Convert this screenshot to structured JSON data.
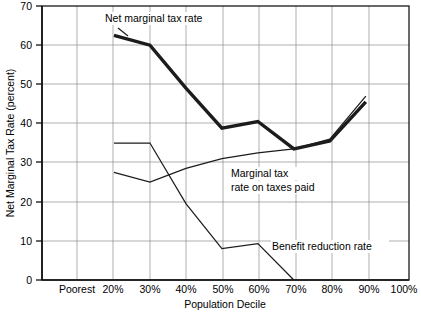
{
  "chart_data": {
    "type": "line",
    "title": "",
    "xlabel": "Population Decile",
    "ylabel": "Net Marginal Tax Rate (percent)",
    "ylim": [
      0,
      70
    ],
    "yticks": [
      0,
      10,
      20,
      30,
      40,
      50,
      60,
      70
    ],
    "ytick_labels": [
      "0",
      "10",
      "20",
      "30",
      "40",
      "50",
      "60",
      "70"
    ],
    "categories": [
      "Poorest",
      "20%",
      "30%",
      "40%",
      "50%",
      "60%",
      "70%",
      "80%",
      "90%",
      "100%"
    ],
    "grid": true,
    "legend_position": "inline-annotations",
    "series": [
      {
        "name": "Net marginal tax rate",
        "style": "thick",
        "x": [
          "20%",
          "30%",
          "40%",
          "50%",
          "60%",
          "70%",
          "80%",
          "90%"
        ],
        "values": [
          62.5,
          60.0,
          49.0,
          38.8,
          40.5,
          33.5,
          35.5,
          45.5
        ]
      },
      {
        "name": "Marginal tax rate on taxes paid",
        "style": "thin",
        "x": [
          "20%",
          "30%",
          "40%",
          "50%",
          "60%",
          "70%",
          "80%",
          "90%"
        ],
        "values": [
          27.5,
          25.0,
          28.5,
          31.0,
          32.5,
          33.5,
          36.0,
          47.0
        ]
      },
      {
        "name": "Benefit reduction rate",
        "style": "thin",
        "x": [
          "20%",
          "30%",
          "40%",
          "50%",
          "60%",
          "70%"
        ],
        "values": [
          35.0,
          35.0,
          19.5,
          8.0,
          9.3,
          0.0
        ]
      }
    ],
    "annotations": [
      {
        "text": "Net marginal tax rate",
        "x_px": 105,
        "y_px": 22
      },
      {
        "text": "Marginal tax",
        "x_px": 231,
        "y_px": 177
      },
      {
        "text": "rate on taxes paid",
        "x_px": 231,
        "y_px": 191
      },
      {
        "text": "Benefit reduction rate",
        "x_px": 272,
        "y_px": 250
      }
    ]
  },
  "axes": {
    "y_title": "Net Marginal Tax Rate (percent)",
    "x_title": "Population Decile",
    "y_tick_labels": [
      "70",
      "60",
      "50",
      "40",
      "30",
      "20",
      "10",
      "0"
    ],
    "x_tick_labels": [
      "Poorest",
      "20%",
      "30%",
      "40%",
      "50%",
      "60%",
      "70%",
      "80%",
      "90%",
      "100%"
    ]
  },
  "labels": {
    "net_marginal": "Net marginal tax rate",
    "marginal_line1": "Marginal tax",
    "marginal_line2": "rate on taxes paid",
    "benefit": "Benefit reduction rate"
  },
  "colors": {
    "ink": "#1c1c1c",
    "grid": "#8e8e8e",
    "background": "#ffffff"
  }
}
